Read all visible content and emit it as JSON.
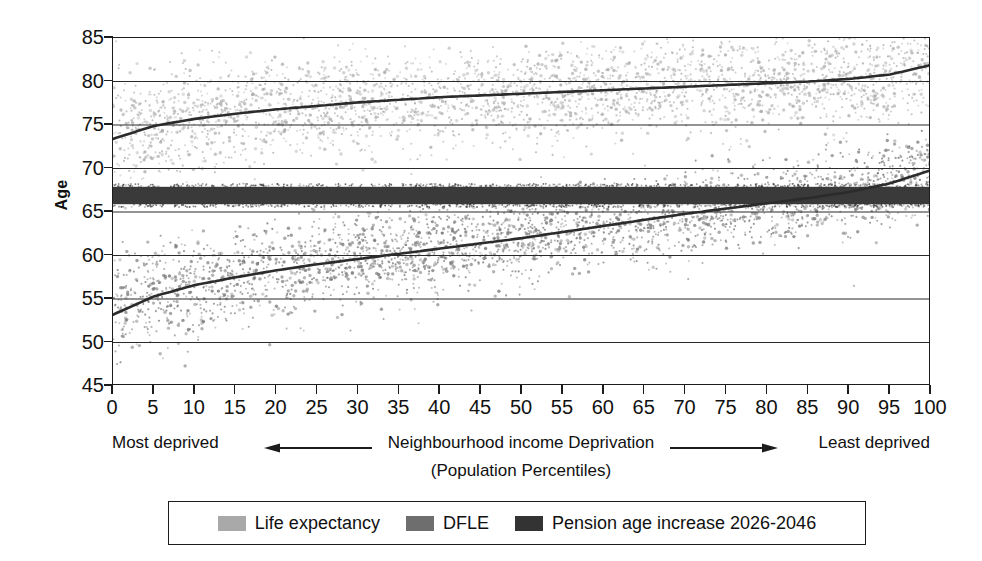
{
  "chart_data": {
    "type": "scatter",
    "title": "",
    "xlabel": "Neighbourhood income Deprivation (Population Percentiles)",
    "ylabel": "Age",
    "xlim": [
      0,
      100
    ],
    "ylim": [
      45,
      85
    ],
    "grid": true,
    "legend_position": "bottom",
    "x_ticks": [
      "0",
      "5",
      "10",
      "15",
      "20",
      "25",
      "30",
      "35",
      "40",
      "45",
      "50",
      "55",
      "60",
      "65",
      "70",
      "75",
      "80",
      "85",
      "90",
      "95",
      "100"
    ],
    "y_ticks": [
      "45",
      "50",
      "55",
      "60",
      "65",
      "70",
      "75",
      "80",
      "85"
    ],
    "x_axis_caption": {
      "left": "Most deprived",
      "middle": "Neighbourhood income Deprivation",
      "right": "Least deprived",
      "second_line": "(Population Percentiles)",
      "left_arrow": "left-arrow-icon",
      "right_arrow": "right-arrow-icon"
    },
    "series": [
      {
        "name": "Life expectancy",
        "type": "scatter-with-trend",
        "color": "#aaaaaa",
        "trend_color": "#2b2b2b",
        "x": [
          0,
          5,
          10,
          15,
          20,
          25,
          30,
          35,
          40,
          45,
          50,
          55,
          60,
          65,
          70,
          75,
          80,
          85,
          90,
          95,
          100
        ],
        "trend_values": [
          73.4,
          74.9,
          75.7,
          76.3,
          76.8,
          77.2,
          77.6,
          77.9,
          78.2,
          78.4,
          78.6,
          78.8,
          79.0,
          79.2,
          79.4,
          79.6,
          79.8,
          80.0,
          80.3,
          80.8,
          81.9
        ],
        "scatter_spread": 2.6,
        "n_points": 3000
      },
      {
        "name": "DFLE",
        "type": "scatter-with-trend",
        "color": "#767676",
        "trend_color": "#2b2b2b",
        "x": [
          0,
          5,
          10,
          15,
          20,
          25,
          30,
          35,
          40,
          45,
          50,
          55,
          60,
          65,
          70,
          75,
          80,
          85,
          90,
          95,
          100
        ],
        "trend_values": [
          53.2,
          55.3,
          56.6,
          57.5,
          58.3,
          59.0,
          59.6,
          60.2,
          60.8,
          61.4,
          62.0,
          62.7,
          63.4,
          64.1,
          64.8,
          65.4,
          66.0,
          66.6,
          67.3,
          68.3,
          69.8
        ],
        "scatter_spread": 2.4,
        "n_points": 3000
      },
      {
        "name": "Pension age increase 2026-2046",
        "type": "band",
        "color": "#3a3a3a",
        "y_low": 65.9,
        "y_high": 67.9
      }
    ],
    "legend": [
      {
        "label": "Life expectancy",
        "color": "#a9a9a9"
      },
      {
        "label": "DFLE",
        "color": "#6e6e6e"
      },
      {
        "label": "Pension age increase 2026-2046",
        "color": "#333333"
      }
    ]
  }
}
